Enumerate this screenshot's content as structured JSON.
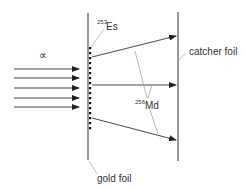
{
  "diagram": {
    "title": "",
    "colors": {
      "line": "#333333",
      "leader": "#999999",
      "background": "#ffffff"
    },
    "labels": {
      "alpha": "∝",
      "es_mass": "253",
      "es_symbol": "Es",
      "md_mass": "256",
      "md_symbol": "Md",
      "catcher_foil": "catcher foil",
      "gold_foil": "gold foil"
    },
    "gold_foil": {
      "x": 88,
      "y1": 13,
      "y2": 160
    },
    "catcher_foil": {
      "x": 178,
      "y1": 12,
      "y2": 161
    },
    "incident_arrows": {
      "label": "alpha particles",
      "count": 5,
      "x_start": 14,
      "x_end": 79,
      "y": [
        69,
        78,
        88,
        98,
        107
      ]
    },
    "target_dots": {
      "x": 90,
      "y": [
        48,
        53,
        58,
        63,
        68,
        73,
        78,
        83,
        88,
        93,
        98,
        103,
        108,
        113,
        118,
        123,
        128
      ]
    },
    "recoil_arrows": [
      {
        "x1": 92,
        "y1": 57,
        "x2": 176,
        "y2": 36
      },
      {
        "x1": 92,
        "y1": 85,
        "x2": 176,
        "y2": 85
      },
      {
        "x1": 92,
        "y1": 118,
        "x2": 176,
        "y2": 140
      }
    ]
  }
}
